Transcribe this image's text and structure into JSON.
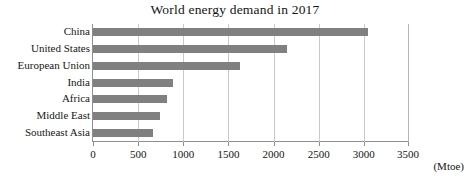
{
  "chart_data": {
    "type": "bar",
    "orientation": "horizontal",
    "title": "World energy demand in 2017",
    "xlabel": "(Mtoe)",
    "ylabel": "",
    "categories": [
      "China",
      "United States",
      "European Union",
      "India",
      "Africa",
      "Middle East",
      "Southeast Asia"
    ],
    "values": [
      3050,
      2150,
      1630,
      890,
      825,
      740,
      660
    ],
    "series": [
      {
        "name": "World energy demand in 2017",
        "values": [
          3050,
          2150,
          1630,
          890,
          825,
          740,
          660
        ]
      }
    ],
    "xlim": [
      0,
      3500
    ],
    "xticks": [
      0,
      500,
      1000,
      1500,
      2000,
      2500,
      3000,
      3500
    ],
    "xtick_labels": [
      "0",
      "500",
      "1000",
      "1500",
      "2000",
      "2500",
      "3000",
      "3500"
    ],
    "grid": "vertical",
    "legend": "none",
    "bar_color": "#808080",
    "gridline_color": "#c9c9c9",
    "axis_color": "#8e8e8e",
    "unit_note": "(Mtoe)"
  }
}
